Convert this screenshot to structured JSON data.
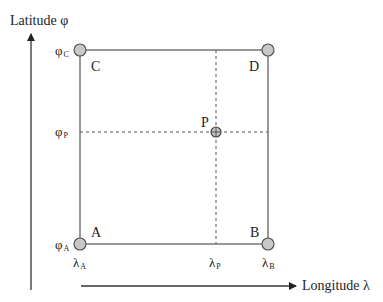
{
  "axes": {
    "latitude_label": "Latitude φ",
    "longitude_label": "Longitude λ"
  },
  "corners": {
    "A": "A",
    "B": "B",
    "C": "C",
    "D": "D"
  },
  "point": {
    "label": "P"
  },
  "latitude_ticks": [
    {
      "symbol": "φ",
      "sub": "C"
    },
    {
      "symbol": "φ",
      "sub": "P"
    },
    {
      "symbol": "φ",
      "sub": "A"
    }
  ],
  "longitude_ticks": [
    {
      "symbol": "λ",
      "sub": "A"
    },
    {
      "symbol": "λ",
      "sub": "P"
    },
    {
      "symbol": "λ",
      "sub": "B"
    }
  ],
  "colors": {
    "line": "#555555",
    "node_fill": "#c8c8c8",
    "node_stroke": "#555555"
  }
}
